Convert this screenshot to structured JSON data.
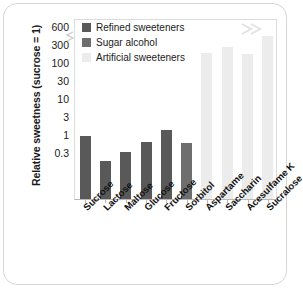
{
  "chart_data": {
    "type": "bar",
    "title": "",
    "xlabel": "",
    "ylabel": "Relative sweetness (sucrose = 1)",
    "yscale": "log",
    "ylim": [
      0.15,
      600
    ],
    "ytick_labels": [
      "600",
      "300",
      "100",
      "30",
      "10",
      "3",
      "1",
      "0.3"
    ],
    "ytick_values": [
      600,
      300,
      100,
      30,
      10,
      3,
      1,
      0.3
    ],
    "axis_break": "between 300 and 600",
    "grid": false,
    "legend_position": "top-left inside plot",
    "categories": [
      "Sucrose",
      "Lactose",
      "Maltose",
      "Glucose",
      "Fructose",
      "Sorbitol",
      "Aspartame",
      "Saccharin",
      "Acesulfame K",
      "Sucralose"
    ],
    "values": [
      1,
      0.2,
      0.35,
      0.7,
      1.5,
      0.65,
      200,
      300,
      190,
      600
    ],
    "groups": [
      "Refined sweeteners",
      "Refined sweeteners",
      "Refined sweeteners",
      "Refined sweeteners",
      "Refined sweeteners",
      "Sugar alcohol",
      "Artificial sweeteners",
      "Artificial sweeteners",
      "Artificial sweeteners",
      "Artificial sweeteners"
    ],
    "annotations": [
      "Sucralose bar is truncated with an axis-break symbol, value exceeds the 600 top of scale"
    ],
    "series": [
      {
        "name": "Refined sweeteners",
        "color": "#595959"
      },
      {
        "name": "Sugar alcohol",
        "color": "#6e6e6e"
      },
      {
        "name": "Artificial sweeteners",
        "color": "#ececec"
      }
    ]
  },
  "legend": {
    "items": [
      {
        "label": "Refined sweeteners",
        "color": "#595959"
      },
      {
        "label": "Sugar alcohol",
        "color": "#6e6e6e"
      },
      {
        "label": "Artificial sweeteners",
        "color": "#ececec"
      }
    ]
  },
  "colors": {
    "refined": "#595959",
    "sugar_alcohol": "#6e6e6e",
    "artificial": "#ececec",
    "frame": "#d6d6d6",
    "axis": "#b9b9b9",
    "text": "#1a1a1a"
  }
}
